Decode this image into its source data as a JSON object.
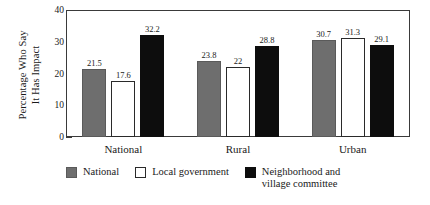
{
  "chart_data": {
    "type": "bar",
    "title": "",
    "xlabel": "",
    "ylabel": "Percentage Who Say\nIt Has Impact",
    "ylabel_line1": "Percentage Who Say",
    "ylabel_line2": "It Has Impact",
    "ylim": [
      0,
      40
    ],
    "yticks": [
      0,
      10,
      20,
      30,
      40
    ],
    "ytick_labels": [
      "0",
      "10",
      "20",
      "30",
      "40"
    ],
    "grid": false,
    "legend_position": "bottom",
    "categories": [
      "National",
      "Rural",
      "Urban"
    ],
    "series": [
      {
        "name": "National",
        "color": "#6e6e6e",
        "values": [
          21.5,
          23.8,
          30.7
        ],
        "value_labels": [
          "21.5",
          "23.8",
          "30.7"
        ]
      },
      {
        "name": "Local government",
        "color": "#ffffff",
        "values": [
          17.6,
          22.0,
          31.3
        ],
        "value_labels": [
          "17.6",
          "22",
          "31.3"
        ]
      },
      {
        "name": "Neighborhood and village committee",
        "color": "#0d0d0d",
        "values": [
          32.2,
          28.8,
          29.1
        ],
        "value_labels": [
          "32.2",
          "28.8",
          "29.1"
        ]
      }
    ],
    "legend": [
      {
        "label": "National",
        "color": "#6e6e6e"
      },
      {
        "label": "Local government",
        "color": "#ffffff"
      },
      {
        "label": "Neighborhood and\nvillage committee",
        "color": "#0d0d0d"
      }
    ]
  }
}
